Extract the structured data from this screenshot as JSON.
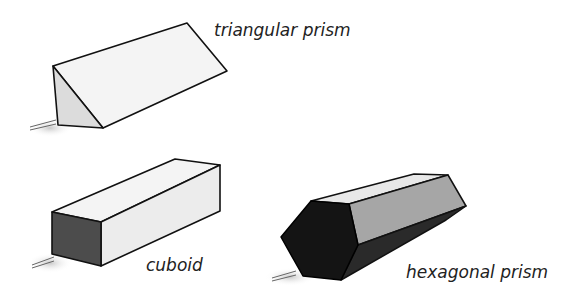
{
  "shapes": [
    {
      "id": "triangular-prism",
      "label": "triangular prism"
    },
    {
      "id": "cuboid",
      "label": "cuboid"
    },
    {
      "id": "hexagonal-prism",
      "label": "hexagonal prism"
    }
  ],
  "colors": {
    "outline": "#111111",
    "light_face": "#f2f2f2",
    "mid_face": "#d4d4d4",
    "dark_face": "#4a4a4a",
    "black_face": "#151515",
    "grey_face": "#9a9a9a"
  }
}
